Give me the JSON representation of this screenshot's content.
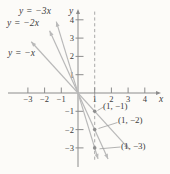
{
  "chart_data": {
    "type": "line",
    "title": "",
    "axes": {
      "xlabel": "x",
      "ylabel": "y",
      "x_ticks": [
        -3,
        -2,
        -1,
        1,
        2,
        3,
        4
      ],
      "y_ticks": [
        4,
        3,
        2,
        1,
        -1,
        -2,
        -3
      ],
      "xlim": [
        -4.2,
        4.9
      ],
      "ylim": [
        -4.1,
        4.6
      ],
      "grid": false
    },
    "lines": [
      {
        "label": "y = −x",
        "slope": -1,
        "intercept": 0,
        "x_range": [
          -2.8,
          3.05
        ]
      },
      {
        "label": "y = −2x",
        "slope": -2,
        "intercept": 0,
        "x_range": [
          -1.7,
          1.8
        ]
      },
      {
        "label": "y = −3x",
        "slope": -3,
        "intercept": 0,
        "x_range": [
          -1.3,
          1.2
        ]
      }
    ],
    "guide_line": {
      "style": "vertical-dashed",
      "x": 1,
      "y_range": [
        -3.7,
        4.45
      ]
    },
    "points": [
      {
        "x": 1,
        "y": -1,
        "label": "(1, −1)"
      },
      {
        "x": 1,
        "y": -2,
        "label": "(1, −2)"
      },
      {
        "x": 1,
        "y": -3,
        "label": "(1, −3)"
      }
    ],
    "colors": {
      "line": "#b9b9b9",
      "axis": "#8c8c8c",
      "dashed": "#9f9f9f",
      "point": "#8f8f8f",
      "leader": "#9f9f9f",
      "text": "#3d3d3d",
      "background": "#fcfbf8"
    }
  }
}
